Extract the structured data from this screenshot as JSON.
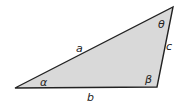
{
  "diagram": {
    "type": "triangle",
    "fill_color": "#d9d9d9",
    "stroke_color": "#222222",
    "vertices": {
      "left": [
        15,
        88
      ],
      "bottom_right": [
        157,
        87
      ],
      "top": [
        173,
        7
      ]
    },
    "sides": {
      "a": "a",
      "b": "b",
      "c": "c"
    },
    "angles": {
      "alpha": "α",
      "beta": "β",
      "theta": "θ"
    }
  }
}
